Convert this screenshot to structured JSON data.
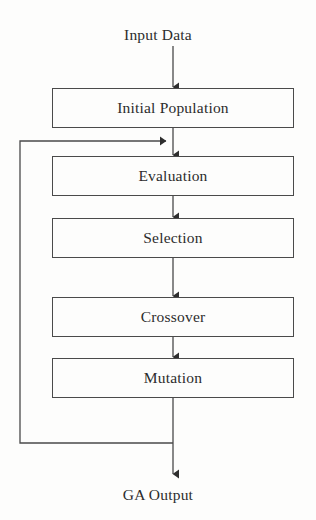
{
  "diagram": {
    "type": "flowchart",
    "background_color": "#fdfdfc",
    "line_color": "#4a4a4a",
    "text_color": "#2c2c2c",
    "input_label": "Input Data",
    "output_label": "GA Output",
    "nodes": [
      {
        "id": "initial-population",
        "label": "Initial Population",
        "x": 52,
        "y": 88,
        "width": 242,
        "height": 40
      },
      {
        "id": "evaluation",
        "label": "Evaluation",
        "x": 52,
        "y": 156,
        "width": 242,
        "height": 40
      },
      {
        "id": "selection",
        "label": "Selection",
        "x": 52,
        "y": 218,
        "width": 242,
        "height": 40
      },
      {
        "id": "crossover",
        "label": "Crossover",
        "x": 52,
        "y": 297,
        "width": 242,
        "height": 40
      },
      {
        "id": "mutation",
        "label": "Mutation",
        "x": 52,
        "y": 358,
        "width": 242,
        "height": 40
      }
    ],
    "edges": [
      {
        "id": "input-to-initial-population",
        "from": "Input Data",
        "to": "Initial Population",
        "arrow": true
      },
      {
        "id": "initial-population-to-evaluation",
        "from": "Initial Population",
        "to": "Evaluation",
        "arrow": true
      },
      {
        "id": "evaluation-to-selection",
        "from": "Evaluation",
        "to": "Selection",
        "arrow": true
      },
      {
        "id": "selection-to-crossover",
        "from": "Selection",
        "to": "Crossover",
        "arrow": true
      },
      {
        "id": "crossover-to-mutation",
        "from": "Crossover",
        "to": "Mutation",
        "arrow": true
      },
      {
        "id": "mutation-to-output",
        "from": "Mutation",
        "to": "GA Output",
        "arrow": true
      },
      {
        "id": "feedback-loop",
        "from": "Mutation",
        "to": "Evaluation",
        "arrow": true,
        "style": "loop-left"
      }
    ]
  }
}
